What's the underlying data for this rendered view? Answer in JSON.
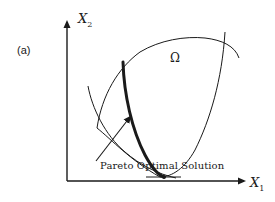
{
  "figure": {
    "panel_label": "(a)",
    "y_axis_label": "X",
    "y_axis_sub": "2",
    "x_axis_label": "X",
    "x_axis_sub": "1",
    "region_label": "Ω",
    "annotation": "Pareto Optimal Solution"
  },
  "colors": {
    "line": "#1a1a1a",
    "background": "#ffffff"
  }
}
